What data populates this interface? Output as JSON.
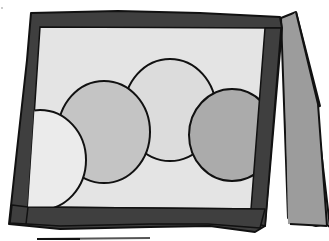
{
  "illustration": {
    "subject": "tent-card picture frame with overlapping circles",
    "colors": {
      "background": "#ffffff",
      "frame": "#3f3f3f",
      "panel": "#e4e4e4",
      "back_flap": "#9c9c9c",
      "outline": "#111111",
      "circle_light": "#ebebeb",
      "circle_mid": "#c4c4c4",
      "circle_pale": "#dcdcdc",
      "circle_dark": "#ababab",
      "base_line": "#555555"
    },
    "circles": [
      {
        "name": "left",
        "shade": "light"
      },
      {
        "name": "center-left",
        "shade": "mid"
      },
      {
        "name": "center-right",
        "shade": "pale"
      },
      {
        "name": "right",
        "shade": "dark"
      }
    ]
  }
}
